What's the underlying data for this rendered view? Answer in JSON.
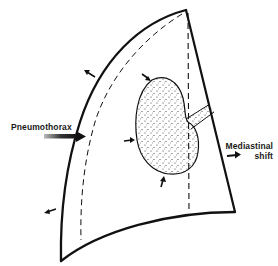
{
  "diagram": {
    "labels": {
      "pneumothorax": "Pneumothorax",
      "mediastinal_line1": "Mediastinal",
      "mediastinal_line2": "shift"
    },
    "elements": [
      "chest-wall-outline",
      "collapsed-lung-boundary-dashed",
      "midline-dashed",
      "collapsed-lung",
      "bronchus",
      "compression-arrows",
      "chest-wall-expansion-arrows",
      "pneumothorax-arrow",
      "mediastinal-shift-arrow"
    ],
    "colors": {
      "line": "#111111",
      "background": "#ffffff",
      "stipple": "#333333"
    }
  }
}
